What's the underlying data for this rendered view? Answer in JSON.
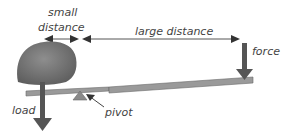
{
  "diagram": {
    "labels": {
      "small_distance_line1": "small",
      "small_distance_line2": "distance",
      "large_distance": "large distance",
      "force": "force",
      "load": "load",
      "pivot": "pivot"
    },
    "colors": {
      "arrow": "#555555",
      "beam": "#9a9a9a",
      "rock": "#7a7a7a",
      "pivot": "#8a8a8a",
      "text": "#444444"
    }
  }
}
